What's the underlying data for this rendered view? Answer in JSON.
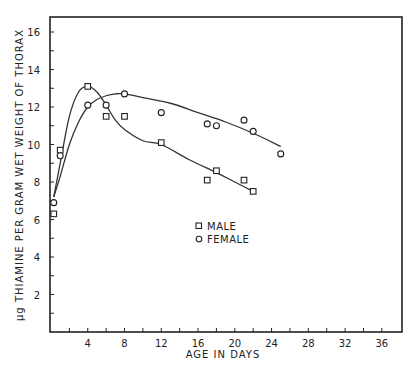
{
  "chart_data": {
    "type": "scatter",
    "title": "",
    "xlabel": "AGE IN DAYS",
    "ylabel": "µg THIAMINE PER GRAM WET WEIGHT OF THORAX",
    "xlim": [
      0,
      38
    ],
    "ylim": [
      0,
      16.8
    ],
    "x_ticks": [
      4,
      8,
      12,
      16,
      20,
      24,
      28,
      32,
      36
    ],
    "y_ticks": [
      2,
      4,
      6,
      8,
      10,
      12,
      14,
      16
    ],
    "grid": false,
    "legend_position": "center",
    "series": [
      {
        "name": "MALE",
        "marker": "square",
        "points": [
          [
            0.3,
            6.3
          ],
          [
            1.0,
            9.7
          ],
          [
            4,
            13.1
          ],
          [
            6,
            11.5
          ],
          [
            8,
            11.5
          ],
          [
            12,
            10.1
          ],
          [
            17,
            8.1
          ],
          [
            18,
            8.6
          ],
          [
            21,
            8.1
          ],
          [
            22,
            7.5
          ]
        ],
        "curve": [
          [
            0.3,
            7.2
          ],
          [
            1,
            9.0
          ],
          [
            2,
            11.5
          ],
          [
            3,
            12.8
          ],
          [
            4,
            13.1
          ],
          [
            5,
            12.8
          ],
          [
            6,
            12.1
          ],
          [
            7,
            11.3
          ],
          [
            8,
            10.8
          ],
          [
            10,
            10.2
          ],
          [
            12,
            10.0
          ],
          [
            15,
            9.2
          ],
          [
            18,
            8.5
          ],
          [
            20,
            8.0
          ],
          [
            22,
            7.5
          ]
        ]
      },
      {
        "name": "FEMALE",
        "marker": "circle",
        "points": [
          [
            0.3,
            6.9
          ],
          [
            1.0,
            9.4
          ],
          [
            4,
            12.1
          ],
          [
            6,
            12.1
          ],
          [
            8,
            12.7
          ],
          [
            12,
            11.7
          ],
          [
            17,
            11.1
          ],
          [
            18,
            11.0
          ],
          [
            21,
            11.3
          ],
          [
            22,
            10.7
          ],
          [
            25,
            9.5
          ]
        ],
        "curve": [
          [
            0.3,
            7.2
          ],
          [
            1,
            8.3
          ],
          [
            2,
            10.0
          ],
          [
            3,
            11.2
          ],
          [
            4,
            12.0
          ],
          [
            5,
            12.4
          ],
          [
            6,
            12.6
          ],
          [
            7,
            12.7
          ],
          [
            8,
            12.7
          ],
          [
            10,
            12.5
          ],
          [
            13,
            12.2
          ],
          [
            16,
            11.7
          ],
          [
            19,
            11.2
          ],
          [
            22,
            10.6
          ],
          [
            25,
            9.9
          ]
        ]
      }
    ]
  }
}
